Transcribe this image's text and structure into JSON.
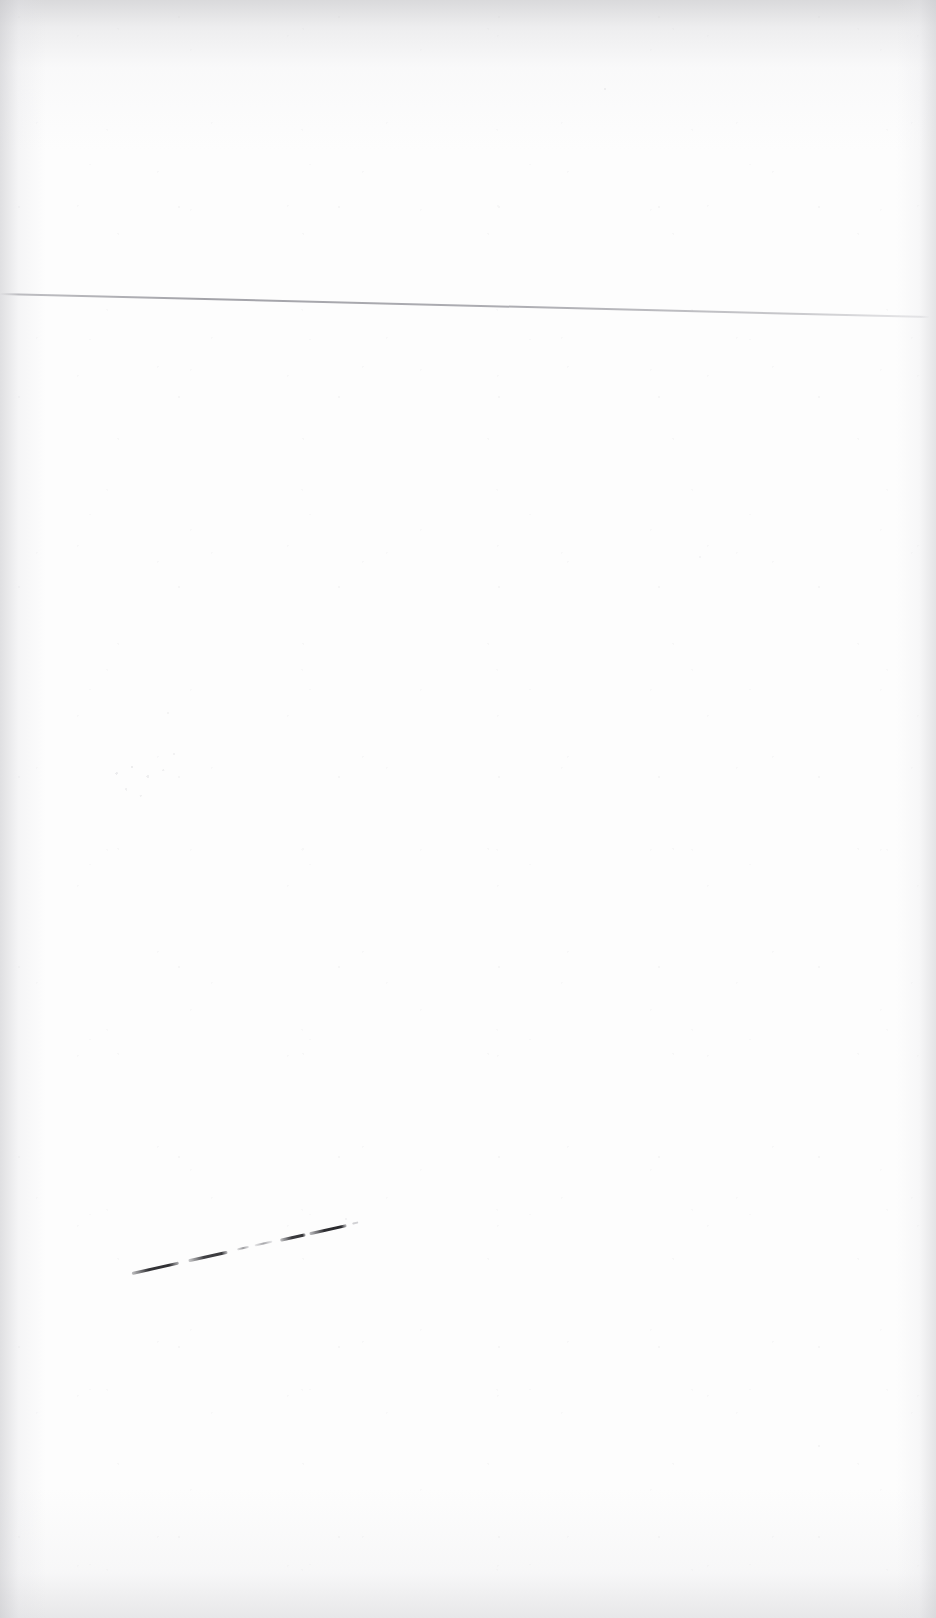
{
  "document": {
    "kind": "scanned-blank-page",
    "page_width": 936,
    "page_height": 1618,
    "background_color": "#fdfdfd",
    "ink_color": "#1e1e22",
    "rule_color": "#808088",
    "visible_text": "",
    "notes_text": ""
  },
  "artifacts": {
    "rule": {
      "name": "horizontal-rule",
      "x": 0,
      "y": 293,
      "length": 930,
      "thickness": 2,
      "angle_degrees": 1.42,
      "color": "#808088",
      "opacity": "0.7"
    },
    "ink_stroke": {
      "name": "dashed-diagonal-pen-stroke",
      "x": 132,
      "y": 1272,
      "length": 232,
      "angle_degrees": -12.6,
      "color": "#1e1e22",
      "segment_count": 7,
      "segments": [
        {
          "offset": 0,
          "length": 48,
          "weight": 3,
          "opacity": 0.92
        },
        {
          "offset": 58,
          "length": 40,
          "weight": 3,
          "opacity": 0.88
        },
        {
          "offset": 108,
          "length": 12,
          "weight": 2,
          "opacity": 0.55
        },
        {
          "offset": 126,
          "length": 18,
          "weight": 2,
          "opacity": 0.5
        },
        {
          "offset": 152,
          "length": 26,
          "weight": 3,
          "opacity": 0.9
        },
        {
          "offset": 182,
          "length": 38,
          "weight": 3,
          "opacity": 0.94
        },
        {
          "offset": 226,
          "length": 6,
          "weight": 2,
          "opacity": 0.3
        }
      ]
    },
    "specks": {
      "name": "residual-toner-specks",
      "x": 95,
      "y": 735,
      "width": 120,
      "height": 80,
      "color": "#a0a0a8",
      "opacity": "0.30"
    }
  },
  "scan": {
    "vignette_color": "#c4c4c7",
    "top_band_height": 150,
    "bottom_band_height": 130,
    "left_band_width": 46,
    "right_band_width": 40,
    "grain_opacity": "0.55"
  }
}
